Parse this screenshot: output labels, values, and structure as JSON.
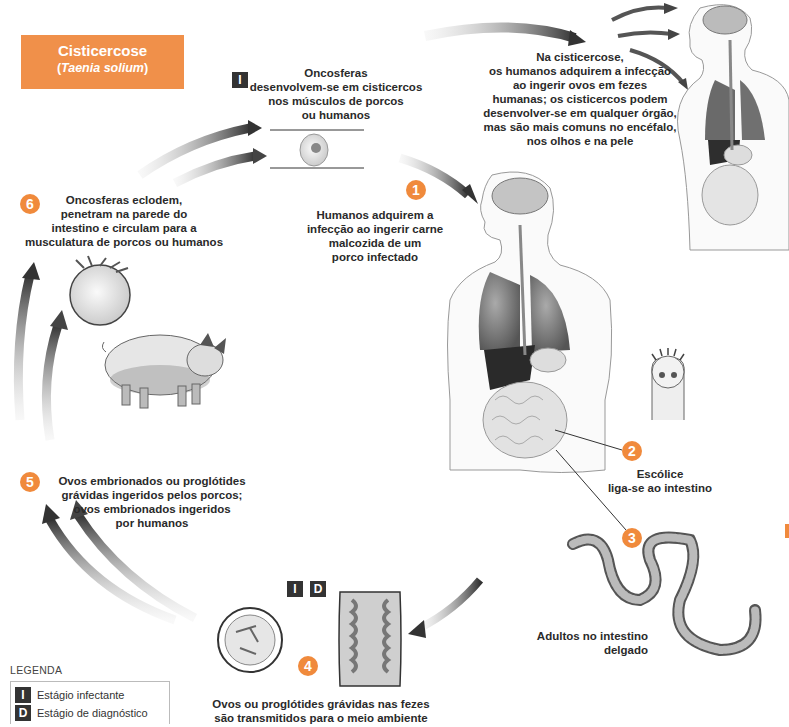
{
  "title": {
    "main": "Cisticercose",
    "species": "Taenia solium",
    "color": "#f0904a"
  },
  "stages": [
    {
      "number": "1",
      "text": "Humanos adquirem a\ninfecção ao ingerir carne\nmalcozida de um\nporco infectado"
    },
    {
      "number": "2",
      "text": "Escólice\nliga-se ao intestino"
    },
    {
      "number": "3",
      "text": "Adultos no intestino\ndelgado"
    },
    {
      "number": "4",
      "text": "Ovos ou proglótides grávidas nas fezes\nsão transmitidos para o meio ambiente",
      "badges": [
        "I",
        "D"
      ]
    },
    {
      "number": "5",
      "text": "Ovos embrionados ou proglótides\ngrávidas ingeridos pelos porcos;\novos embrionados ingeridos\npor humanos"
    },
    {
      "number": "6",
      "text": "Oncosferas eclodem,\npenetram na parede do\nintestino e circulam para a\nmusculatura de porcos ou humanos"
    }
  ],
  "cysticerci_note": {
    "badge": "I",
    "text": "Oncosferas\ndesenvolvem-se em cisticercos\nnos músculos de porcos\nou humanos"
  },
  "cisticercose_note": {
    "text": "Na cisticercose,\nos humanos adquirem a infecção\nao ingerir ovos em fezes\nhumanas; os cisticercos podem\ndesenvolver-se em qualquer órgão,\nmas são mais comuns no encéfalo,\nnos olhos e na pele"
  },
  "legend": {
    "title": "LEGENDA",
    "items": [
      {
        "badge": "I",
        "label": "Estágio infectante"
      },
      {
        "badge": "D",
        "label": "Estágio de diagnóstico"
      }
    ]
  },
  "colors": {
    "accent_orange": "#f08a3c",
    "arrow_dark": "#3a3a3a",
    "badge_dark": "#333333"
  }
}
